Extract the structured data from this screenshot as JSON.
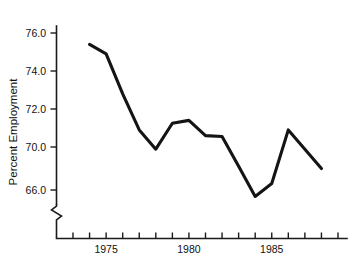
{
  "chart_data": {
    "type": "line",
    "title": "",
    "subtitle": "",
    "xlabel": "",
    "ylabel": "Percent Employment",
    "x": [
      1974,
      1975,
      1976,
      1977,
      1978,
      1979,
      1980,
      1981,
      1982,
      1983,
      1984,
      1985,
      1986,
      1988
    ],
    "values": [
      75.4,
      74.9,
      72.8,
      70.9,
      69.8,
      71.25,
      71.4,
      70.6,
      70.55,
      68.2,
      65.4,
      66.6,
      70.9,
      68.0
    ],
    "series": [
      {
        "name": "Percent Employment",
        "values": [
          75.4,
          74.9,
          72.8,
          70.9,
          69.8,
          71.25,
          71.4,
          70.6,
          70.55,
          68.2,
          65.4,
          66.6,
          70.9,
          68.0
        ]
      }
    ],
    "ylim": [
      64.0,
      77.0
    ],
    "xlim": [
      1973,
      1989
    ],
    "y_tick_labels": [
      "76.0",
      "74.0",
      "72.0",
      "70.0",
      "66.0"
    ],
    "y_tick_values": [
      76.0,
      74.0,
      72.0,
      70.0,
      66.0
    ],
    "x_tick_values": [
      1973,
      1974,
      1975,
      1976,
      1977,
      1978,
      1979,
      1980,
      1981,
      1982,
      1983,
      1984,
      1985,
      1986,
      1987,
      1988,
      1989
    ],
    "x_labeled_ticks": [
      {
        "value": 1975,
        "label": "1975"
      },
      {
        "value": 1980,
        "label": "1980"
      },
      {
        "value": 1985,
        "label": "1985"
      }
    ],
    "axis_break": true,
    "axis_break_note": "y-axis break below 66.0",
    "grid": false,
    "legend": false,
    "legend_position": "none",
    "line_color": "#141414",
    "background_color": "#ffffff"
  }
}
